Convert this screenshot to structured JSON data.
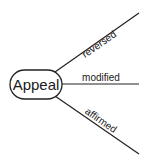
{
  "diagram": {
    "root": {
      "label": "Appeal"
    },
    "branches": [
      {
        "label": "reversed"
      },
      {
        "label": "modified"
      },
      {
        "label": "affirmed"
      }
    ]
  }
}
